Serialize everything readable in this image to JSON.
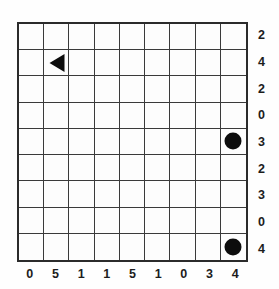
{
  "puzzle": {
    "title": "Nine by nine grid puzzle",
    "grid": {
      "rows": 9,
      "columns": 9,
      "line_color": "#3a3a3a",
      "border_color": "#2b2b2b",
      "cell_background": "#fdfdfd"
    },
    "column_labels": [
      "0",
      "5",
      "1",
      "1",
      "5",
      "1",
      "0",
      "3",
      "4"
    ],
    "row_labels": [
      "2",
      "4",
      "2",
      "0",
      "3",
      "2",
      "3",
      "0",
      "4"
    ],
    "pieces": [
      {
        "name": "triangle-left",
        "shape": "triangle-left",
        "row": 2,
        "column": 2,
        "color": "#0d0d0d"
      },
      {
        "name": "circle-upper",
        "shape": "circle",
        "row": 5,
        "column": 9,
        "color": "#0d0d0d"
      },
      {
        "name": "circle-lower",
        "shape": "circle",
        "row": 9,
        "column": 9,
        "color": "#0d0d0d"
      }
    ]
  }
}
